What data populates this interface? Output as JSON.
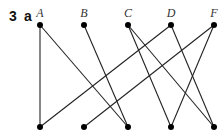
{
  "question": {
    "number": "3",
    "part": "a"
  },
  "top_nodes": [
    {
      "label": "A",
      "x": 40,
      "y": 25
    },
    {
      "label": "B",
      "x": 84,
      "y": 25
    },
    {
      "label": "C",
      "x": 128,
      "y": 25
    },
    {
      "label": "D",
      "x": 171,
      "y": 25
    },
    {
      "label": "F",
      "x": 214,
      "y": 25
    }
  ],
  "bottom_nodes": [
    {
      "label": "1",
      "x": 40,
      "y": 127
    },
    {
      "label": "2",
      "x": 84,
      "y": 127
    },
    {
      "label": "3",
      "x": 128,
      "y": 127
    },
    {
      "label": "4",
      "x": 171,
      "y": 127
    },
    {
      "label": "5",
      "x": 214,
      "y": 127
    }
  ],
  "edges": [
    [
      "A",
      "1"
    ],
    [
      "A",
      "3"
    ],
    [
      "B",
      "3"
    ],
    [
      "C",
      "4"
    ],
    [
      "C",
      "5"
    ],
    [
      "D",
      "1"
    ],
    [
      "D",
      "5"
    ],
    [
      "F",
      "2"
    ],
    [
      "F",
      "4"
    ]
  ]
}
